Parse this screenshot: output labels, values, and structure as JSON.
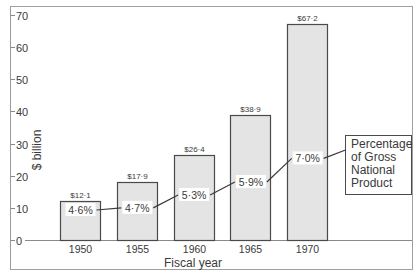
{
  "chart_data": {
    "type": "bar",
    "title": "",
    "xlabel": "Fiscal year",
    "ylabel": "$ billion",
    "ylim": [
      0,
      70
    ],
    "yticks": [
      0,
      10,
      20,
      30,
      40,
      50,
      60,
      70
    ],
    "ytick_labels": [
      "0",
      "10",
      "20",
      "30",
      "40",
      "50",
      "60",
      "70"
    ],
    "grid": false,
    "categories": [
      "1950",
      "1955",
      "1960",
      "1965",
      "1970"
    ],
    "series": [
      {
        "name": "$ billion",
        "values": [
          12.1,
          17.9,
          26.4,
          38.9,
          67.2
        ],
        "data_labels": [
          "$12·1",
          "$17·9",
          "$26·4",
          "$38·9",
          "$67·2"
        ]
      },
      {
        "name": "Percentage of Gross National Product",
        "type": "line",
        "values": [
          4.6,
          4.7,
          5.3,
          5.9,
          7.0
        ],
        "data_labels": [
          "4·6%",
          "4·7%",
          "5·3%",
          "5·9%",
          "7·0%"
        ]
      }
    ],
    "legend": {
      "position": "right",
      "lines": [
        "Percentage",
        "of Gross",
        "National",
        "Product"
      ]
    },
    "colors": {
      "bar_fill": "#e4e4e4",
      "bar_stroke": "#4a4a4a",
      "line": "#3a3a3a",
      "frame": "#9a9a9a",
      "text": "#3a3a3a"
    }
  }
}
